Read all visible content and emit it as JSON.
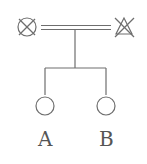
{
  "diagram": {
    "type": "pedigree",
    "parents": [
      {
        "symbol": "circle-crossed",
        "meaning": "deceased female"
      },
      {
        "symbol": "triangle-crossed",
        "meaning": "deceased"
      }
    ],
    "union": "double-line",
    "children": [
      {
        "symbol": "circle",
        "label": "A"
      },
      {
        "symbol": "circle",
        "label": "B"
      }
    ],
    "stroke_color": "#777777"
  }
}
